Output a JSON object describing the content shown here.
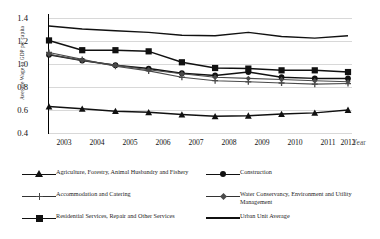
{
  "chart_data": {
    "type": "line",
    "title": "",
    "xlabel": "Year",
    "ylabel": "Average Wage to GDP per capita",
    "x": [
      2003,
      2004,
      2005,
      2006,
      2007,
      2008,
      2009,
      2010,
      2011,
      2012
    ],
    "xtick_labels": [
      "2003",
      "2004",
      "2005",
      "2006",
      "2007",
      "2008",
      "2009",
      "2010",
      "2011",
      "2012"
    ],
    "ytick_labels": [
      "1.4",
      "1.2",
      "1.0",
      "0.8",
      "0.6",
      "0.4"
    ],
    "ylim": [
      0.4,
      1.4
    ],
    "ytick_step": 0.2,
    "grid": true,
    "legend_position": "bottom",
    "series": [
      {
        "name": "Agriculture, Forestry, Animal Husbandry and Fishery",
        "marker": "triangle",
        "color": "#111111",
        "values": [
          0.63,
          0.61,
          0.59,
          0.58,
          0.56,
          0.545,
          0.55,
          0.565,
          0.575,
          0.6
        ]
      },
      {
        "name": "Construction",
        "marker": "circle",
        "color": "#111111",
        "values": [
          1.08,
          1.03,
          0.99,
          0.96,
          0.92,
          0.9,
          0.93,
          0.885,
          0.875,
          0.875
        ]
      },
      {
        "name": "Accommodation and Catering",
        "marker": "plus",
        "color": "#4a4a4a",
        "values": [
          1.1,
          1.04,
          0.98,
          0.94,
          0.885,
          0.855,
          0.845,
          0.835,
          0.825,
          0.83
        ]
      },
      {
        "name": "Water Conservancy, Environment and Utility Management",
        "marker": "diamond",
        "color": "#4a4a4a",
        "values": [
          1.085,
          1.03,
          0.99,
          0.95,
          0.915,
          0.885,
          0.875,
          0.865,
          0.855,
          0.845
        ]
      },
      {
        "name": "Residential Services, Repair and Other Services",
        "marker": "square",
        "color": "#111111",
        "values": [
          1.205,
          1.12,
          1.12,
          1.11,
          1.015,
          0.965,
          0.96,
          0.945,
          0.945,
          0.93
        ]
      },
      {
        "name": "Urban Unit Average",
        "marker": "none",
        "color": "#111111",
        "values": [
          1.33,
          1.305,
          1.29,
          1.275,
          1.25,
          1.245,
          1.275,
          1.24,
          1.225,
          1.245
        ]
      }
    ]
  },
  "legend": {
    "items": [
      {
        "label": "Agriculture, Forestry, Animal Husbandry and Fishery",
        "marker": "triangle"
      },
      {
        "label": "Construction",
        "marker": "circle"
      },
      {
        "label": "Accommodation and Catering",
        "marker": "plus"
      },
      {
        "label": "Water Conservancy, Environment and Utility Management",
        "marker": "diamond"
      },
      {
        "label": "Residential Services, Repair and Other Services",
        "marker": "square"
      },
      {
        "label": "Urban Unit Average",
        "marker": "none"
      }
    ]
  }
}
